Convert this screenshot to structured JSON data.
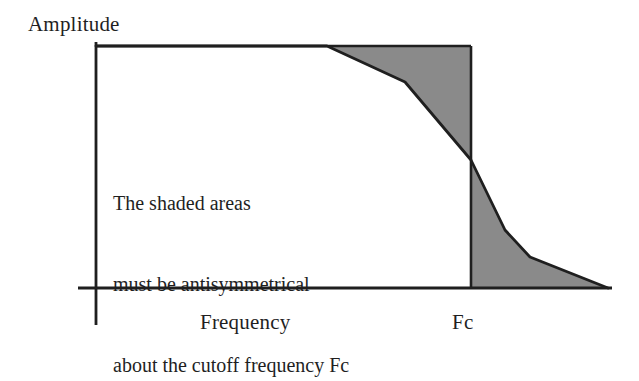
{
  "figure": {
    "title": "",
    "background_color": "#ffffff",
    "line_color": "#1f1f1f",
    "shade_color": "#8a8a8a",
    "annotation": {
      "lines": [
        "The shaded areas",
        "must be antisymmetrical",
        "about the cutoff frequency Fc"
      ]
    },
    "labels": {
      "y_axis": "Amplitude",
      "x_axis": "Frequency",
      "cutoff": "Fc"
    }
  },
  "chart_data": {
    "type": "area",
    "title": "",
    "xlabel": "Frequency",
    "ylabel": "Amplitude",
    "grid": false,
    "legend": null,
    "annotations": [
      "The shaded areas",
      "must be antisymmetrical",
      "about the cutoff frequency Fc"
    ],
    "axes": {
      "origin_px": [
        96,
        288
      ],
      "x_axis_px": {
        "x1": 78,
        "x2": 612,
        "y": 288
      },
      "y_axis_px": {
        "x": 96,
        "y1": 42,
        "y2": 325
      }
    },
    "cutoff": {
      "label": "Fc",
      "x_px": 471,
      "value": "Fc"
    },
    "ideal_response_px": {
      "description": "ideal brick-wall: flat at passband top from origin to Fc, then drops to zero",
      "top_y": 46,
      "points": [
        [
          96,
          46
        ],
        [
          471,
          46
        ],
        [
          471,
          288
        ],
        [
          612,
          288
        ]
      ]
    },
    "actual_response_px": {
      "description": "real filter response curve: flat passband, gradual rolloff through Fc, long stopband tail",
      "points": [
        [
          96,
          46
        ],
        [
          327,
          46
        ],
        [
          405,
          82
        ],
        [
          471,
          160
        ],
        [
          505,
          230
        ],
        [
          530,
          257
        ],
        [
          608,
          288
        ]
      ]
    },
    "shaded_regions": [
      {
        "name": "upper-shaded-area",
        "position": "above response curve, below ideal top, left of Fc",
        "fill": "#8a8a8a",
        "polygon_px": [
          [
            327,
            46
          ],
          [
            471,
            46
          ],
          [
            471,
            160
          ],
          [
            405,
            82
          ]
        ]
      },
      {
        "name": "lower-shaded-area",
        "position": "below response curve, above x-axis, right of Fc",
        "fill": "#8a8a8a",
        "polygon_px": [
          [
            471,
            160
          ],
          [
            505,
            230
          ],
          [
            530,
            257
          ],
          [
            608,
            288
          ],
          [
            471,
            288
          ]
        ]
      }
    ]
  }
}
